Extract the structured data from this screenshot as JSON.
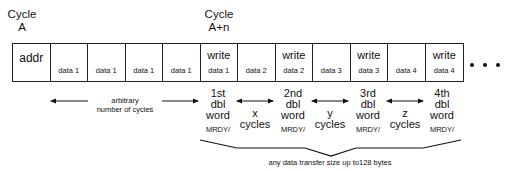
{
  "cycle_labels": [
    {
      "line1": "Cycle",
      "line2": "A"
    },
    {
      "line1": "Cycle",
      "line2": "A+n"
    }
  ],
  "cells": [
    {
      "top": "addr",
      "bottom": ""
    },
    {
      "top": "",
      "bottom": "data 1"
    },
    {
      "top": "",
      "bottom": "data 1"
    },
    {
      "top": "",
      "bottom": "data 1"
    },
    {
      "top": "",
      "bottom": "data 1"
    },
    {
      "top": "write",
      "bottom": "data 1"
    },
    {
      "top": "",
      "bottom": "data 2"
    },
    {
      "top": "write",
      "bottom": "data 2"
    },
    {
      "top": "",
      "bottom": "data 3"
    },
    {
      "top": "write",
      "bottom": "data 3"
    },
    {
      "top": "",
      "bottom": "data 4"
    },
    {
      "top": "write",
      "bottom": "data 4"
    }
  ],
  "ellipsis": "• • •",
  "arbitrary_label": {
    "line1": "arbitrary",
    "line2": "number of cycles"
  },
  "dbl_words": [
    {
      "line1": "1st",
      "line2": "dbl",
      "line3": "word",
      "signal": "MRDY/"
    },
    {
      "line1": "2nd",
      "line2": "dbl",
      "line3": "word",
      "signal": "MRDY/"
    },
    {
      "line1": "3rd",
      "line2": "dbl",
      "line3": "word",
      "signal": "MRDY/"
    },
    {
      "line1": "4th",
      "line2": "dbl",
      "line3": "word",
      "signal": "MRDY/"
    }
  ],
  "gaps": [
    {
      "line1": "x",
      "line2": "cycles"
    },
    {
      "line1": "y",
      "line2": "cycles"
    },
    {
      "line1": "z",
      "line2": "cycles"
    }
  ],
  "brace_label": "any data transfer size up to128 bytes"
}
